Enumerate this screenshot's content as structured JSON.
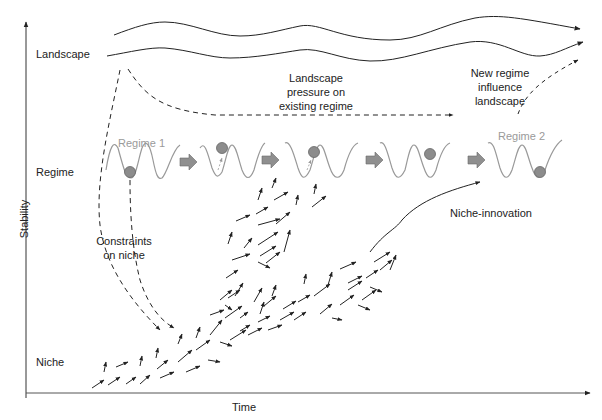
{
  "axes": {
    "y_label": "Stability",
    "x_label": "Time"
  },
  "levels": {
    "landscape": "Landscape",
    "regime": "Regime",
    "niche": "Niche"
  },
  "regimes": {
    "regime_1": "Regime 1",
    "regime_2": "Regime 2"
  },
  "annotations": {
    "landscape_pressure": "Landscape\npressure on\nexisting regime",
    "new_regime_influence": "New regime\ninfluence\nlandscape",
    "constraints_on_niche": "Constraints\non niche",
    "niche_innovation": "Niche-innovation"
  },
  "colors": {
    "line": "#222222",
    "regime_curve": "#9a9a9a",
    "ball": "#8c8c8c",
    "transition_arrow": "#8f8f8f",
    "regime_label": "#9a9a9a"
  }
}
